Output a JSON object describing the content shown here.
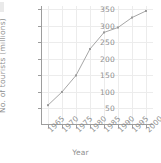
{
  "chart_data": {
    "type": "line",
    "title": "",
    "xlabel": "Year",
    "ylabel": "No. of tourists (millions)",
    "x": [
      1965,
      1970,
      1975,
      1980,
      1985,
      1990,
      1995,
      2000
    ],
    "categories": [
      "1965",
      "1970",
      "1975",
      "1980",
      "1985",
      "1990",
      "1995",
      "2000"
    ],
    "values": [
      60,
      100,
      150,
      230,
      280,
      295,
      325,
      345
    ],
    "series": [
      {
        "name": "No. of tourists",
        "values": [
          60,
          100,
          150,
          230,
          280,
          295,
          325,
          345
        ]
      }
    ],
    "yticks": [
      50,
      100,
      150,
      200,
      250,
      300,
      350
    ],
    "yticklabels": [
      "50",
      "100",
      "150",
      "200",
      "250",
      "300",
      "350"
    ],
    "xticks": [
      1965,
      1970,
      1975,
      1980,
      1985,
      1990,
      1995,
      2000
    ],
    "xticklabels": [
      "1965",
      "1970",
      "1975",
      "1980",
      "1985",
      "1990",
      "1995",
      "2000"
    ],
    "xlim": [
      1962.5,
      2002.5
    ],
    "ylim": [
      0,
      360
    ],
    "grid": true,
    "legend": false,
    "legend_position": "none",
    "line_color": "#a6a6a6",
    "marker": "dot",
    "marker_color": "#9a9a9a",
    "grid_color": "#ececec",
    "axis_color": "#9d9d9d",
    "text_color": "#8f8f8f",
    "background": "#ffffff"
  }
}
